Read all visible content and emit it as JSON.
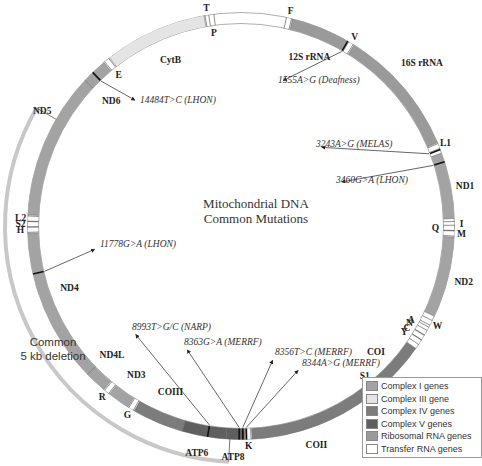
{
  "title": {
    "line1": "Mitochondrial DNA",
    "line2": "Common Mutations"
  },
  "deletion_label": {
    "line1": "Common",
    "line2": "5 kb deletion"
  },
  "colors": {
    "complex_i": "#a3a3a3",
    "complex_iii": "#e4e4e4",
    "complex_iv": "#7c7c7c",
    "complex_v": "#5f5f5f",
    "rrna": "#9a9a9a",
    "trna": "#ffffff",
    "deletion_arc": "#c8c8c8"
  },
  "legend": [
    {
      "label": "Complex I genes",
      "key": "complex_i"
    },
    {
      "label": "Complex III gene",
      "key": "complex_iii"
    },
    {
      "label": "Complex IV genes",
      "key": "complex_iv"
    },
    {
      "label": "Complex V genes",
      "key": "complex_v"
    },
    {
      "label": "Ribosomal RNA genes",
      "key": "rrna"
    },
    {
      "label": "Transfer RNA genes",
      "key": "trna"
    }
  ],
  "circle": {
    "cx": 241,
    "cy": 226,
    "r": 208,
    "width": 11
  },
  "genes": [
    {
      "name": "12S rRNA",
      "start": 14,
      "end": 30,
      "key": "rrna",
      "label_angle": 22,
      "label_offset": 20
    },
    {
      "name": "16S rRNA",
      "start": 32,
      "end": 67,
      "key": "rrna",
      "label_angle": 48,
      "label_offset": -30
    },
    {
      "name": "ND1",
      "start": 70,
      "end": 88,
      "key": "complex_i",
      "label_angle": 80,
      "label_offset": -14
    },
    {
      "name": "ND2",
      "start": 93,
      "end": 115,
      "key": "complex_i",
      "label_angle": 104,
      "label_offset": -16
    },
    {
      "name": "COI",
      "start": 125,
      "end": 140,
      "key": "complex_iv",
      "label_angle": 133,
      "label_offset": 18
    },
    {
      "name": "COII",
      "start": 142,
      "end": 177,
      "key": "complex_iv",
      "label_angle": 161,
      "label_offset": -18
    },
    {
      "name": "ATP8",
      "start": 179,
      "end": 184,
      "key": "complex_v",
      "label_angle": 182,
      "label_offset": -18
    },
    {
      "name": "ATP6",
      "start": 184,
      "end": 196,
      "key": "complex_v",
      "label_angle": 191,
      "label_offset": -18
    },
    {
      "name": "COIII",
      "start": 196,
      "end": 210,
      "key": "complex_iv",
      "label_angle": 203,
      "label_offset": 22
    },
    {
      "name": "ND3",
      "start": 212,
      "end": 218,
      "key": "complex_i",
      "label_angle": 215,
      "label_offset": 20
    },
    {
      "name": "ND4L",
      "start": 220,
      "end": 226,
      "key": "complex_i",
      "label_angle": 225,
      "label_offset": 20
    },
    {
      "name": "ND4",
      "start": 226,
      "end": 268,
      "key": "complex_i",
      "label_angle": 250,
      "label_offset": 20
    },
    {
      "name": "ND5",
      "start": 273,
      "end": 313,
      "key": "complex_i",
      "label_angle": 300,
      "label_offset": -16
    },
    {
      "name": "ND6",
      "start": 313,
      "end": 320,
      "key": "complex_i",
      "label_angle": 314,
      "label_offset": 22
    },
    {
      "name": "CytB",
      "start": 322,
      "end": 350,
      "key": "complex_iii",
      "label_angle": 337,
      "label_offset": 22
    }
  ],
  "trnas": [
    {
      "name": "F",
      "angle": 13,
      "side": "out"
    },
    {
      "name": "V",
      "angle": 31,
      "side": "out"
    },
    {
      "name": "L1",
      "angle": 68,
      "side": "out"
    },
    {
      "name": "I",
      "angle": 89.5,
      "side": "out"
    },
    {
      "name": "Q",
      "angle": 90.5,
      "side": "in"
    },
    {
      "name": "M",
      "angle": 92,
      "side": "out"
    },
    {
      "name": "W",
      "angle": 117,
      "side": "out"
    },
    {
      "name": "A",
      "angle": 119,
      "side": "in"
    },
    {
      "name": "N",
      "angle": 120,
      "side": "in"
    },
    {
      "name": "C",
      "angle": 121.5,
      "side": "in"
    },
    {
      "name": "Y",
      "angle": 123,
      "side": "in"
    },
    {
      "name": "S1",
      "angle": 140.5,
      "side": "in"
    },
    {
      "name": "D",
      "angle": 141.5,
      "side": "out"
    },
    {
      "name": "K",
      "angle": 178,
      "side": "out"
    },
    {
      "name": "G",
      "angle": 211,
      "side": "out"
    },
    {
      "name": "R",
      "angle": 219,
      "side": "out"
    },
    {
      "name": "H",
      "angle": 269,
      "side": "out"
    },
    {
      "name": "S2",
      "angle": 270.5,
      "side": "out"
    },
    {
      "name": "L2",
      "angle": 272,
      "side": "out"
    },
    {
      "name": "E",
      "angle": 321,
      "side": "in"
    },
    {
      "name": "T",
      "angle": 351,
      "side": "out"
    },
    {
      "name": "P",
      "angle": 352,
      "side": "in"
    }
  ],
  "mutations": [
    {
      "label": "1555A>G (Deafness)",
      "angle": 30,
      "tx": 278,
      "ty": 83
    },
    {
      "label": "3243A>G (MELAS)",
      "angle": 69,
      "tx": 316,
      "ty": 147
    },
    {
      "label": "3460G>A (LHON)",
      "angle": 72.5,
      "tx": 336,
      "ty": 183
    },
    {
      "label": "8344A>G (MERRF)",
      "angle": 178.5,
      "tx": 302,
      "ty": 366
    },
    {
      "label": "8356T>C (MERRF)",
      "angle": 179.5,
      "tx": 275,
      "ty": 355
    },
    {
      "label": "8363G>A (MERRF)",
      "angle": 180.5,
      "tx": 184,
      "ty": 345
    },
    {
      "label": "8993T>G/C (NARP)",
      "angle": 189,
      "tx": 132,
      "ty": 330
    },
    {
      "label": "11778G>A (LHON)",
      "angle": 257,
      "tx": 100,
      "ty": 247
    },
    {
      "label": "14484T>C (LHON)",
      "angle": 316,
      "tx": 140,
      "ty": 103
    }
  ],
  "deletion": {
    "start": 183,
    "end": 300,
    "r": 236
  }
}
